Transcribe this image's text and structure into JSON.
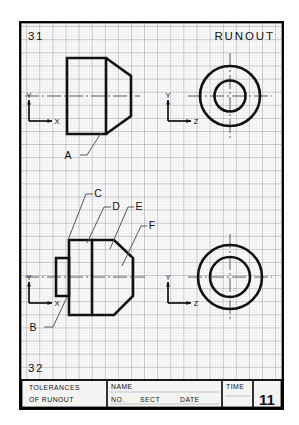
{
  "sheet": {
    "background_color": "#ffffff",
    "border_color": "#000000",
    "grid_minor_color": "#c8c8cc",
    "grid_major_color": "#9a9aa2",
    "ink_color": "#111111"
  },
  "header": {
    "problem_number": "31",
    "title": "RUNOUT"
  },
  "footer": {
    "next_problem_number": "32"
  },
  "labels": {
    "a": "A",
    "b": "B",
    "c": "C",
    "d": "D",
    "e": "E",
    "f": "F"
  },
  "axes": {
    "front_top": {
      "vertical": "Y",
      "horizontal": "X"
    },
    "side_top": {
      "vertical": "Y",
      "horizontal": "Z"
    },
    "front_bottom": {
      "vertical": "Y",
      "horizontal": "X"
    },
    "side_bottom": {
      "vertical": "Y",
      "horizontal": "Z"
    }
  },
  "title_block": {
    "tolerances_line1": "TOLERANCES",
    "tolerances_line2": "OF  RUNOUT",
    "name_label": "NAME",
    "no_label": "NO.",
    "sect_label": "SECT",
    "date_label": "DATE",
    "time_label": "TIME",
    "sheet_number": "11"
  }
}
